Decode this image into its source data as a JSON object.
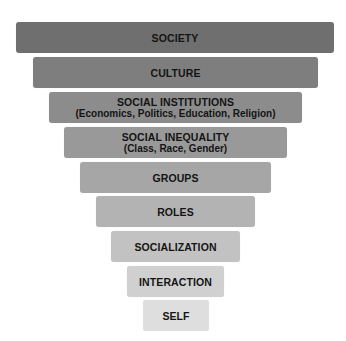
{
  "diagram": {
    "type": "inverted-pyramid",
    "levels": [
      {
        "title": "SOCIETY",
        "subtitle": "",
        "color": "#6f6f6f"
      },
      {
        "title": "CULTURE",
        "subtitle": "",
        "color": "#7e7e7e"
      },
      {
        "title": "SOCIAL INSTITUTIONS",
        "subtitle": "(Economics, Politics, Education, Religion)",
        "color": "#8c8c8c"
      },
      {
        "title": "SOCIAL INEQUALITY",
        "subtitle": "(Class, Race, Gender)",
        "color": "#999999"
      },
      {
        "title": "GROUPS",
        "subtitle": "",
        "color": "#a6a6a6"
      },
      {
        "title": "ROLES",
        "subtitle": "",
        "color": "#b3b3b3"
      },
      {
        "title": "SOCIALIZATION",
        "subtitle": "",
        "color": "#c2c2c2"
      },
      {
        "title": "INTERACTION",
        "subtitle": "",
        "color": "#d0d0d0"
      },
      {
        "title": "SELF",
        "subtitle": "",
        "color": "#dedede"
      }
    ]
  }
}
